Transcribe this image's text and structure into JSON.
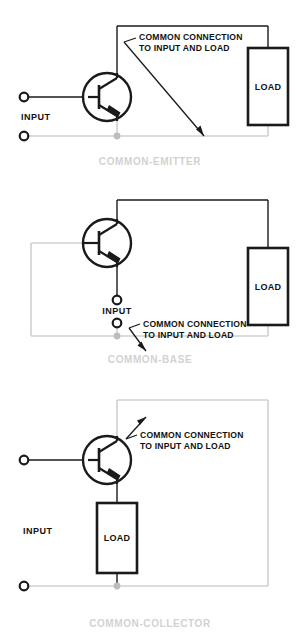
{
  "figure_title": "Transistor Amplifier Configurations",
  "colors": {
    "wire_black": "#1a1a1a",
    "wire_gray": "#d0d0d0",
    "junction_gray": "#bdbdbd",
    "caption_gray": "#d2d2d2",
    "text_black": "#111111",
    "background": "#ffffff"
  },
  "common_labels": {
    "input": "INPUT",
    "load": "LOAD",
    "annotation_line1": "COMMON CONNECTION",
    "annotation_line2": "TO INPUT AND LOAD"
  },
  "circuits": [
    {
      "id": "common-emitter",
      "caption": "COMMON-EMITTER",
      "input_label": "INPUT",
      "load_label": "LOAD",
      "annotation_line1": "COMMON CONNECTION",
      "annotation_line2": "TO INPUT AND LOAD",
      "transistor_type": "NPN",
      "common_terminal": "emitter",
      "input_terminal": "base",
      "output_terminal": "collector"
    },
    {
      "id": "common-base",
      "caption": "COMMON-BASE",
      "input_label": "INPUT",
      "load_label": "LOAD",
      "annotation_line1": "COMMON CONNECTION",
      "annotation_line2": "TO INPUT AND LOAD",
      "transistor_type": "NPN",
      "common_terminal": "base",
      "input_terminal": "emitter",
      "output_terminal": "collector"
    },
    {
      "id": "common-collector",
      "caption": "COMMON-COLLECTOR",
      "input_label": "INPUT",
      "load_label": "LOAD",
      "annotation_line1": "COMMON CONNECTION",
      "annotation_line2": "TO INPUT AND LOAD",
      "transistor_type": "NPN",
      "common_terminal": "collector",
      "input_terminal": "base",
      "output_terminal": "emitter"
    }
  ]
}
